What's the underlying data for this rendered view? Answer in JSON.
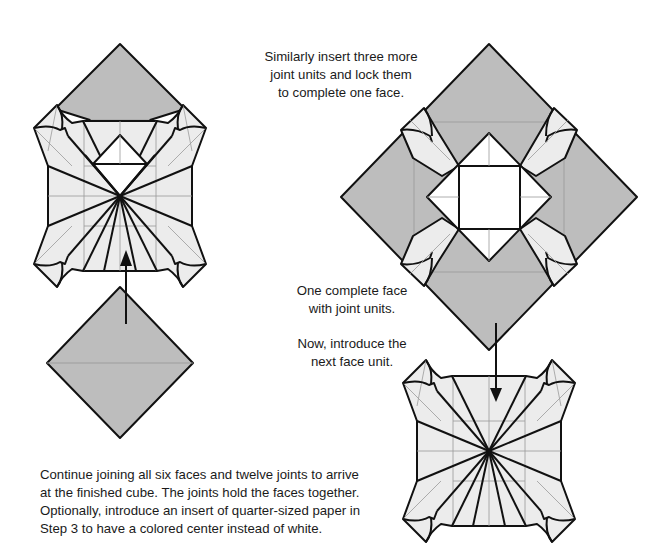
{
  "diagram": {
    "colors": {
      "gray_paper": "#bdbdbd",
      "light_paper": "#ececec",
      "white_paper": "#ffffff",
      "outline": "#111111",
      "crease": "#9a9a9a"
    },
    "captions": {
      "top": "Similarly insert three more\njoint units and lock them\nto complete one face.",
      "middle_1": "One complete face\nwith joint units.",
      "middle_2": "Now, introduce the\nnext face unit.",
      "bottom": "Continue joining all six faces and twelve joints to arrive\nat the finished cube.  The joints hold the faces together.\nOptionally, introduce an insert of quarter-sized paper in\nStep 3 to have a colored center instead of white."
    },
    "figures": [
      {
        "id": "left-step",
        "description": "Face unit with three joint units inserted, gray joint unit on top, gray joint unit below with up arrow"
      },
      {
        "id": "complete-face",
        "description": "One complete face with four gray joint units forming a large diamond"
      },
      {
        "id": "next-face",
        "description": "Next face unit with down arrow indicating insertion"
      }
    ],
    "arrows": [
      {
        "id": "up-arrow",
        "direction": "up"
      },
      {
        "id": "down-arrow",
        "direction": "down"
      }
    ]
  }
}
